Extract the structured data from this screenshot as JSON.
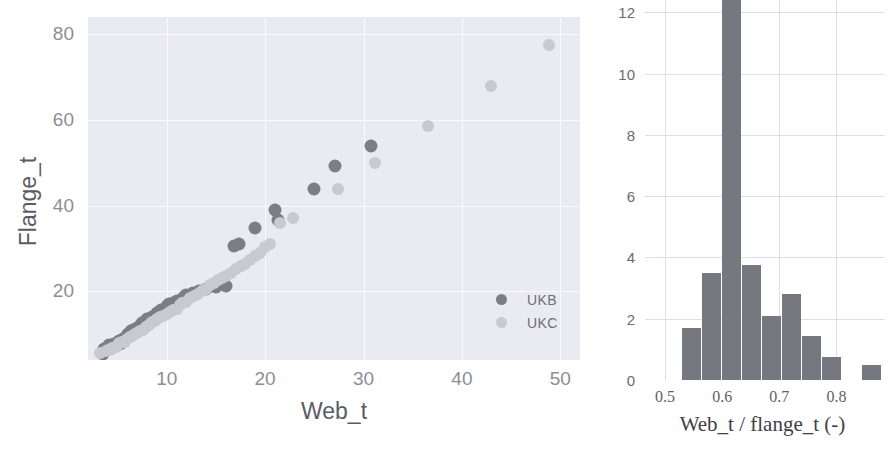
{
  "figure": {
    "background": "#ffffff",
    "width": 895,
    "height": 449,
    "colors": {
      "ukb": "#7d7d86",
      "ukc": "#c9c9d0",
      "hist_bar": "#77777f",
      "scatter_panel_bg": "#eaeaf2",
      "scatter_grid": "#ffffff",
      "hist_grid": "#dedee4",
      "tick_text": "#8d8d96",
      "label_text": "#5b5b63"
    }
  },
  "chart_data": [
    {
      "type": "scatter",
      "title": "",
      "xlabel": "Web_t",
      "ylabel": "Flange_t",
      "xlim": [
        2.0,
        52.0
      ],
      "ylim": [
        4.0,
        84.0
      ],
      "xticks": [
        10,
        20,
        30,
        40,
        50
      ],
      "yticks": [
        20,
        40,
        60,
        80
      ],
      "grid": true,
      "legend": {
        "position": "lower right",
        "entries": [
          "UKB",
          "UKC"
        ]
      },
      "series": [
        {
          "name": "UKB",
          "color": "#7d7d86",
          "marker": "o",
          "points": [
            [
              3.5,
              5.5
            ],
            [
              3.6,
              6.5
            ],
            [
              4.0,
              6.8
            ],
            [
              4.1,
              7.6
            ],
            [
              4.3,
              6.8
            ],
            [
              4.5,
              7.0
            ],
            [
              4.6,
              7.7
            ],
            [
              5.0,
              8.0
            ],
            [
              5.1,
              8.5
            ],
            [
              5.3,
              7.7
            ],
            [
              5.6,
              9.0
            ],
            [
              5.8,
              8.6
            ],
            [
              6.0,
              9.6
            ],
            [
              6.1,
              10.0
            ],
            [
              6.4,
              10.7
            ],
            [
              6.6,
              10.9
            ],
            [
              7.0,
              11.5
            ],
            [
              7.2,
              11.8
            ],
            [
              7.5,
              12.7
            ],
            [
              7.7,
              12.8
            ],
            [
              8.0,
              13.5
            ],
            [
              8.5,
              14.0
            ],
            [
              8.9,
              14.5
            ],
            [
              9.0,
              15.0
            ],
            [
              9.4,
              15.7
            ],
            [
              9.9,
              16.0
            ],
            [
              10.0,
              16.5
            ],
            [
              10.2,
              17.0
            ],
            [
              10.6,
              17.3
            ],
            [
              11.0,
              17.7
            ],
            [
              11.5,
              17.9
            ],
            [
              11.8,
              18.7
            ],
            [
              12.0,
              19.1
            ],
            [
              12.7,
              19.6
            ],
            [
              13.1,
              19.7
            ],
            [
              13.3,
              20.2
            ],
            [
              14.0,
              20.5
            ],
            [
              14.5,
              21.3
            ],
            [
              15.0,
              21.0
            ],
            [
              15.5,
              21.7
            ],
            [
              16.0,
              21.3
            ],
            [
              16.8,
              30.7
            ],
            [
              17.3,
              31.0
            ],
            [
              19.0,
              34.8
            ],
            [
              21.0,
              38.9
            ],
            [
              21.3,
              36.6
            ],
            [
              25.0,
              43.9
            ],
            [
              27.1,
              49.2
            ],
            [
              30.8,
              54.0
            ]
          ]
        },
        {
          "name": "UKC",
          "color": "#c9c9d0",
          "marker": "o",
          "points": [
            [
              3.2,
              5.6
            ],
            [
              3.8,
              6.0
            ],
            [
              4.0,
              6.4
            ],
            [
              4.2,
              6.3
            ],
            [
              4.4,
              6.8
            ],
            [
              4.8,
              7.1
            ],
            [
              5.0,
              7.5
            ],
            [
              5.2,
              8.0
            ],
            [
              5.5,
              8.2
            ],
            [
              5.8,
              8.3
            ],
            [
              6.0,
              9.0
            ],
            [
              6.3,
              9.4
            ],
            [
              6.5,
              9.6
            ],
            [
              6.8,
              10.0
            ],
            [
              7.0,
              10.2
            ],
            [
              7.3,
              10.7
            ],
            [
              7.6,
              11.0
            ],
            [
              7.9,
              11.6
            ],
            [
              8.2,
              12.2
            ],
            [
              8.5,
              12.8
            ],
            [
              8.8,
              13.1
            ],
            [
              9.0,
              13.5
            ],
            [
              9.3,
              14.0
            ],
            [
              9.6,
              14.3
            ],
            [
              10.0,
              14.8
            ],
            [
              10.3,
              15.2
            ],
            [
              10.6,
              15.6
            ],
            [
              11.0,
              16.0
            ],
            [
              11.3,
              16.8
            ],
            [
              11.6,
              17.2
            ],
            [
              12.0,
              17.5
            ],
            [
              12.4,
              18.4
            ],
            [
              12.8,
              19.0
            ],
            [
              13.2,
              19.4
            ],
            [
              13.6,
              20.0
            ],
            [
              14.0,
              20.6
            ],
            [
              14.4,
              21.4
            ],
            [
              14.8,
              22.0
            ],
            [
              15.2,
              22.6
            ],
            [
              15.6,
              23.2
            ],
            [
              16.0,
              23.7
            ],
            [
              16.5,
              24.4
            ],
            [
              17.0,
              25.2
            ],
            [
              17.5,
              26.0
            ],
            [
              18.0,
              26.5
            ],
            [
              18.5,
              27.4
            ],
            [
              19.0,
              28.2
            ],
            [
              19.5,
              29.0
            ],
            [
              20.0,
              30.4
            ],
            [
              20.5,
              31.0
            ],
            [
              21.5,
              36.0
            ],
            [
              22.8,
              37.2
            ],
            [
              27.4,
              44.0
            ],
            [
              31.2,
              50.0
            ],
            [
              36.6,
              58.6
            ],
            [
              43.0,
              67.9
            ],
            [
              48.9,
              77.5
            ]
          ]
        }
      ]
    },
    {
      "type": "bar",
      "subtype": "histogram",
      "title": "",
      "xlabel": "Web_t / flange_t (-)",
      "ylabel": "",
      "xlim": [
        0.465,
        0.885
      ],
      "ylim": [
        0,
        12.6
      ],
      "xticks": [
        0.5,
        0.6,
        0.7,
        0.8
      ],
      "xtick_labels": [
        "0.5",
        "0.6",
        "0.7",
        "0.8"
      ],
      "yticks": [
        0,
        2,
        4,
        6,
        8,
        10,
        12
      ],
      "ytick_labels": [
        "0",
        "2",
        "4",
        "6",
        "8",
        "10",
        "12"
      ],
      "grid": true,
      "bar_color": "#77777f",
      "bin_edges": [
        0.53,
        0.565,
        0.6,
        0.635,
        0.67,
        0.705,
        0.74,
        0.775,
        0.81,
        0.845
      ],
      "bin_centers": [
        0.5475,
        0.5825,
        0.6175,
        0.6525,
        0.6875,
        0.7225,
        0.7575,
        0.7925,
        0.8625
      ],
      "values": [
        1.7,
        3.5,
        12.6,
        3.75,
        2.1,
        2.8,
        1.45,
        0.75,
        0.5
      ],
      "note_clipped_bar": "third bar exceeds axis top and is cut off"
    }
  ],
  "scatter": {
    "xlabel": "Web_t",
    "ylabel": "Flange_t",
    "xticks": [
      "10",
      "20",
      "30",
      "40",
      "50"
    ],
    "yticks": [
      "80",
      "60",
      "40",
      "20"
    ],
    "legend": {
      "ukb_label": "UKB",
      "ukc_label": "UKC"
    }
  },
  "histogram": {
    "xlabel": "Web_t / flange_t (-)",
    "xticks": [
      "0.5",
      "0.6",
      "0.7",
      "0.8"
    ],
    "yticks": [
      "12",
      "10",
      "8",
      "6",
      "4",
      "2",
      "0"
    ]
  }
}
